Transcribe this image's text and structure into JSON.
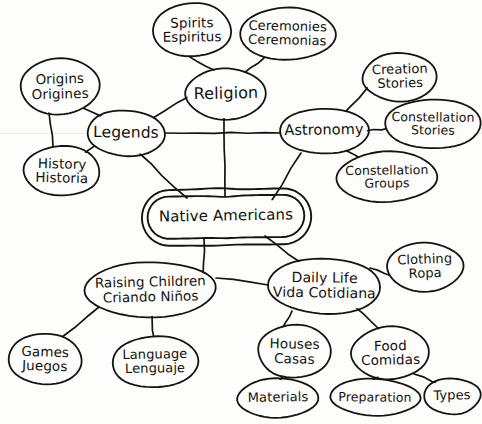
{
  "diagram": {
    "type": "concept-map",
    "style": "hand-drawn",
    "ink_color": "#17140f",
    "background_color": "#fdfdfb",
    "nodes": [
      {
        "id": "spirits",
        "label": "Spirits\nEspiritus",
        "en": "Spirits",
        "es": "Espiritus",
        "x": 153,
        "y": 3,
        "w": 78,
        "h": 54,
        "shape": "ellipse",
        "level": "leaf",
        "font": 13.5,
        "rot": -0.6
      },
      {
        "id": "ceremonies",
        "label": "Ceremonies\nCeremonias",
        "en": "Ceremonies",
        "es": "Ceremonias",
        "x": 240,
        "y": 8,
        "w": 95,
        "h": 52,
        "shape": "ellipse",
        "level": "leaf",
        "font": 13,
        "rot": 1.2
      },
      {
        "id": "origins",
        "label": "Origins\nOrigines",
        "en": "Origins",
        "es": "Origines",
        "x": 20,
        "y": 59,
        "w": 80,
        "h": 55,
        "shape": "ellipse",
        "level": "leaf",
        "font": 13.5,
        "rot": -1.5
      },
      {
        "id": "religion",
        "label": "Religion",
        "en": "Religion",
        "es": "",
        "x": 186,
        "y": 69,
        "w": 80,
        "h": 50,
        "shape": "ellipse",
        "level": "branch",
        "font": 16,
        "rot": -1
      },
      {
        "id": "creation-stories",
        "label": "Creation\nStories",
        "en": "Creation Stories",
        "es": "",
        "x": 363,
        "y": 53,
        "w": 74,
        "h": 48,
        "shape": "ellipse",
        "level": "leaf",
        "font": 13,
        "rot": -1.4
      },
      {
        "id": "legends",
        "label": "Legends",
        "en": "Legends",
        "es": "",
        "x": 87,
        "y": 110,
        "w": 78,
        "h": 46,
        "shape": "ellipse",
        "level": "branch",
        "font": 15.5,
        "rot": 0.8
      },
      {
        "id": "astronomy",
        "label": "Astronomy",
        "en": "Astronomy",
        "es": "",
        "x": 280,
        "y": 108,
        "w": 88,
        "h": 46,
        "shape": "ellipse",
        "level": "branch",
        "font": 14.5,
        "rot": -0.8
      },
      {
        "id": "constellation-stories",
        "label": "Constellation\nStories",
        "en": "Constellation Stories",
        "es": "",
        "x": 385,
        "y": 99,
        "w": 96,
        "h": 50,
        "shape": "ellipse",
        "level": "leaf",
        "font": 12.5,
        "rot": 0.6
      },
      {
        "id": "history",
        "label": "History\nHistoria",
        "en": "History",
        "es": "Historia",
        "x": 24,
        "y": 146,
        "w": 76,
        "h": 50,
        "shape": "ellipse",
        "level": "leaf",
        "font": 13.5,
        "rot": 1.4
      },
      {
        "id": "constellation-groups",
        "label": "Constellation\nGroups",
        "en": "Constellation Groups",
        "es": "",
        "x": 337,
        "y": 152,
        "w": 100,
        "h": 50,
        "shape": "ellipse",
        "level": "leaf",
        "font": 12.5,
        "rot": -0.7
      },
      {
        "id": "native-americans",
        "label": "Native Americans",
        "en": "Native Americans",
        "es": "",
        "x": 148,
        "y": 196,
        "w": 156,
        "h": 42,
        "shape": "double-ellipse",
        "level": "root",
        "font": 15,
        "rot": -0.9
      },
      {
        "id": "clothing",
        "label": "Clothing\nRopa",
        "en": "Clothing",
        "es": "Ropa",
        "x": 387,
        "y": 243,
        "w": 76,
        "h": 48,
        "shape": "ellipse",
        "level": "leaf",
        "font": 13,
        "rot": -2
      },
      {
        "id": "raising-children",
        "label": "Raising Children\nCriando Niños",
        "en": "Raising Children",
        "es": "Criando Niños",
        "x": 85,
        "y": 262,
        "w": 131,
        "h": 55,
        "shape": "ellipse",
        "level": "branch",
        "font": 13.5,
        "rot": -1.3
      },
      {
        "id": "daily-life",
        "label": "Daily Life\nVida Cotidiana",
        "en": "Daily Life",
        "es": "Vida Cotidiana",
        "x": 268,
        "y": 258,
        "w": 113,
        "h": 56,
        "shape": "ellipse",
        "level": "branch",
        "font": 14,
        "rot": 0.9
      },
      {
        "id": "games",
        "label": "Games\nJuegos",
        "en": "Games",
        "es": "Juegos",
        "x": 9,
        "y": 333,
        "w": 72,
        "h": 52,
        "shape": "ellipse",
        "level": "leaf",
        "font": 13.5,
        "rot": 1.6
      },
      {
        "id": "language",
        "label": "Language\nLenguaje",
        "en": "Language",
        "es": "Lenguaje",
        "x": 112,
        "y": 336,
        "w": 86,
        "h": 52,
        "shape": "ellipse",
        "level": "leaf",
        "font": 13,
        "rot": -0.9
      },
      {
        "id": "houses",
        "label": "Houses\nCasas",
        "en": "Houses",
        "es": "Casas",
        "x": 258,
        "y": 325,
        "w": 73,
        "h": 53,
        "shape": "ellipse",
        "level": "leaf",
        "font": 13.5,
        "rot": 1.1
      },
      {
        "id": "food",
        "label": "Food\nComidas",
        "en": "Food",
        "es": "Comidas",
        "x": 352,
        "y": 327,
        "w": 77,
        "h": 52,
        "shape": "ellipse",
        "level": "leaf",
        "font": 13.5,
        "rot": -1.1
      },
      {
        "id": "materials",
        "label": "Materials",
        "en": "Materials",
        "es": "",
        "x": 237,
        "y": 379,
        "w": 82,
        "h": 38,
        "shape": "ellipse",
        "level": "leaf",
        "font": 13,
        "rot": -0.8
      },
      {
        "id": "preparation",
        "label": "Preparation",
        "en": "Preparation",
        "es": "",
        "x": 330,
        "y": 379,
        "w": 90,
        "h": 36,
        "shape": "ellipse",
        "level": "leaf",
        "font": 12.5,
        "rot": 0.7
      },
      {
        "id": "types",
        "label": "Types",
        "en": "Types",
        "es": "",
        "x": 424,
        "y": 378,
        "w": 56,
        "h": 36,
        "shape": "ellipse",
        "level": "leaf",
        "font": 13,
        "rot": -1.2
      }
    ],
    "edges": [
      {
        "from": "spirits",
        "to": "religion",
        "x1": 190,
        "y1": 57,
        "x2": 214,
        "y2": 70
      },
      {
        "from": "ceremonies",
        "to": "religion",
        "x1": 264,
        "y1": 58,
        "x2": 243,
        "y2": 74
      },
      {
        "from": "origins",
        "to": "legends",
        "x1": 83,
        "y1": 108,
        "x2": 110,
        "y2": 120
      },
      {
        "from": "origins",
        "to": "history",
        "x1": 49,
        "y1": 113,
        "x2": 53,
        "y2": 147
      },
      {
        "from": "history",
        "to": "legends",
        "x1": 83,
        "y1": 155,
        "x2": 99,
        "y2": 142
      },
      {
        "from": "legends",
        "to": "religion",
        "x1": 153,
        "y1": 118,
        "x2": 190,
        "y2": 96
      },
      {
        "from": "legends",
        "to": "astronomy",
        "x1": 165,
        "y1": 133,
        "x2": 281,
        "y2": 133
      },
      {
        "from": "legends",
        "to": "native-americans",
        "x1": 139,
        "y1": 153,
        "x2": 187,
        "y2": 198
      },
      {
        "from": "religion",
        "to": "native-americans",
        "x1": 224,
        "y1": 118,
        "x2": 225,
        "y2": 196
      },
      {
        "from": "astronomy",
        "to": "creation-stories",
        "x1": 340,
        "y1": 118,
        "x2": 368,
        "y2": 87
      },
      {
        "from": "astronomy",
        "to": "constellation-stories",
        "x1": 366,
        "y1": 131,
        "x2": 389,
        "y2": 128
      },
      {
        "from": "astronomy",
        "to": "constellation-groups",
        "x1": 347,
        "y1": 151,
        "x2": 369,
        "y2": 163
      },
      {
        "from": "astronomy",
        "to": "native-americans",
        "x1": 301,
        "y1": 153,
        "x2": 272,
        "y2": 200
      },
      {
        "from": "native-americans",
        "to": "daily-life",
        "x1": 265,
        "y1": 236,
        "x2": 300,
        "y2": 262
      },
      {
        "from": "native-americans",
        "to": "raising-children",
        "x1": 204,
        "y1": 238,
        "x2": 203,
        "y2": 277
      },
      {
        "from": "raising-children",
        "to": "daily-life",
        "x1": 216,
        "y1": 278,
        "x2": 268,
        "y2": 285
      },
      {
        "from": "raising-children",
        "to": "games",
        "x1": 99,
        "y1": 307,
        "x2": 62,
        "y2": 337
      },
      {
        "from": "raising-children",
        "to": "language",
        "x1": 152,
        "y1": 315,
        "x2": 154,
        "y2": 338
      },
      {
        "from": "daily-life",
        "to": "clothing",
        "x1": 370,
        "y1": 268,
        "x2": 392,
        "y2": 276
      },
      {
        "from": "daily-life",
        "to": "houses",
        "x1": 292,
        "y1": 311,
        "x2": 283,
        "y2": 327
      },
      {
        "from": "daily-life",
        "to": "food",
        "x1": 355,
        "y1": 307,
        "x2": 379,
        "y2": 329
      },
      {
        "from": "houses",
        "to": "materials",
        "x1": 283,
        "y1": 376,
        "x2": 272,
        "y2": 388
      },
      {
        "from": "food",
        "to": "preparation",
        "x1": 378,
        "y1": 377,
        "x2": 366,
        "y2": 386
      },
      {
        "from": "food",
        "to": "types",
        "x1": 414,
        "y1": 374,
        "x2": 441,
        "y2": 385
      }
    ]
  }
}
